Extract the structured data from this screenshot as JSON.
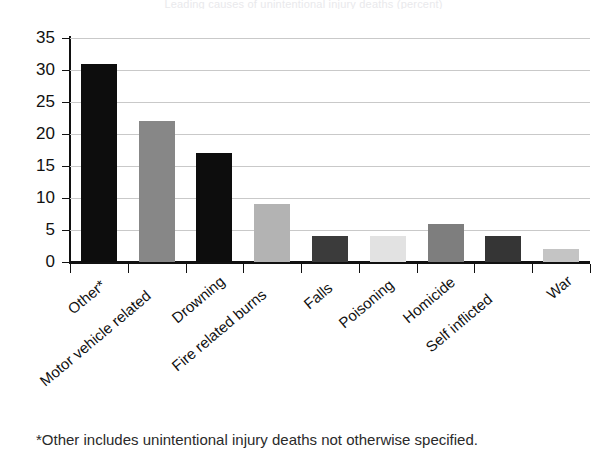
{
  "chart_data": {
    "type": "bar",
    "title": "",
    "xlabel": "",
    "ylabel": "",
    "ylim": [
      0,
      35
    ],
    "yticks": [
      0,
      5,
      10,
      15,
      20,
      25,
      30,
      35
    ],
    "grid": true,
    "legend": null,
    "categories": [
      "Other*",
      "Motor vehicle related",
      "Drowning",
      "Fire related burns",
      "Falls",
      "Poisoning",
      "Homicide",
      "Self inflicted",
      "War"
    ],
    "values": [
      31,
      22,
      17,
      9,
      4,
      4,
      6,
      4,
      2
    ],
    "bar_colors": [
      "#0d0d0d",
      "#878787",
      "#0d0d0d",
      "#b3b3b3",
      "#3b3b3b",
      "#e2e2e2",
      "#7e7e7e",
      "#353535",
      "#c4c4c4"
    ],
    "annotations": [
      "*Other includes unintentional injury deaths not otherwise specified."
    ]
  },
  "axis": {
    "y_tick_labels": [
      "0",
      "5",
      "10",
      "15",
      "20",
      "25",
      "30",
      "35"
    ]
  },
  "footnote": {
    "text": "*Other includes unintentional injury deaths not otherwise specified."
  },
  "title_remnant": {
    "text": "Leading causes of unintentional injury deaths (percent)"
  },
  "colors": {
    "axis": "#111111",
    "grid": "#c9c9c9",
    "background": "#ffffff"
  }
}
